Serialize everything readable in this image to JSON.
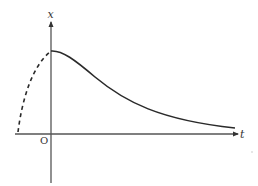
{
  "diagram": {
    "type": "function-graph",
    "axes": {
      "horizontal_label": "t",
      "vertical_label": "x",
      "origin_label": "O"
    },
    "curves": [
      {
        "name": "solid-decay-curve",
        "style": "solid",
        "description": "starts at maximum on x-axis (t=0) and decays asymptotically toward t-axis"
      },
      {
        "name": "dashed-rising-curve",
        "style": "dashed",
        "description": "for t<0, rises from t-axis up to the maximum at t=0"
      }
    ],
    "colors": {
      "axis": "#555555",
      "curve": "#2a2a2a",
      "background": "#ffffff"
    }
  }
}
